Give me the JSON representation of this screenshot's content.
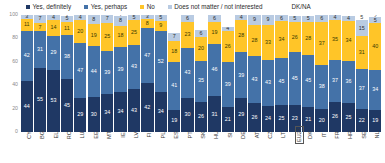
{
  "legend": {
    "items": [
      {
        "label": "Yes, definitely",
        "color": "#1f3864",
        "shape": "square"
      },
      {
        "label": "Yes, perhaps",
        "color": "#4472a8",
        "shape": "square"
      },
      {
        "label": "No",
        "color": "#ffc528",
        "shape": "square"
      },
      {
        "label": "Does not matter / not interested",
        "color": "#b9cbe2",
        "shape": "square"
      }
    ],
    "plain_label": "DK/NA"
  },
  "axis": {
    "y_ticks": [
      "100",
      "80",
      "60",
      "40",
      "20",
      "0"
    ]
  },
  "chart_data": {
    "type": "bar",
    "subtype": "stacked-bar-100-percent",
    "title": "",
    "xlabel": "",
    "ylabel": "",
    "ylim": [
      0,
      100
    ],
    "grid": false,
    "legend_position": "top",
    "categories": [
      "CY",
      "BG",
      "EL",
      "RO",
      "LU",
      "EE",
      "MT",
      "IE",
      "LV",
      "FI",
      "PL",
      "ES",
      "PT",
      "SK",
      "HU",
      "SI",
      "DE",
      "AT",
      "CZ",
      "LT",
      "EU27",
      "DK",
      "IT",
      "FR",
      "HR",
      "SE",
      "NL"
    ],
    "highlight_category": "EU27",
    "series": [
      {
        "name": "Yes, definitely",
        "color": "#1f3864",
        "values": [
          44,
          55,
          53,
          45,
          29,
          30,
          34,
          34,
          43,
          42,
          34,
          19,
          30,
          26,
          31,
          21,
          29,
          26,
          24,
          25,
          23,
          21,
          20,
          26,
          25,
          22,
          19
        ]
      },
      {
        "name": "Yes, perhaps",
        "color": "#4472a8",
        "values": [
          42,
          31,
          29,
          38,
          47,
          44,
          39,
          39,
          43,
          47,
          52,
          41,
          43,
          35,
          46,
          39,
          39,
          43,
          43,
          45,
          45,
          45,
          38,
          37,
          36,
          37,
          34
        ]
      },
      {
        "name": "No",
        "color": "#ffc528",
        "values": [
          11,
          7,
          14,
          11,
          20,
          19,
          25,
          18,
          25,
          8,
          9,
          18,
          23,
          20,
          19,
          26,
          28,
          28,
          33,
          34,
          26,
          28,
          37,
          35,
          34,
          31,
          40
        ]
      },
      {
        "name": "Does not matter / not interested",
        "color": "#b9cbe2",
        "values": [
          3,
          7,
          4,
          5,
          4,
          8,
          7,
          8,
          5,
          3,
          5,
          7,
          6,
          6,
          6,
          4,
          4,
          9,
          9,
          6,
          5,
          5,
          6,
          4,
          4,
          15,
          5
        ]
      },
      {
        "name": "DK/NA",
        "color": "#ffffff",
        "values": [
          0,
          0,
          0,
          1,
          0,
          0,
          0,
          1,
          0,
          0,
          0,
          0,
          0,
          0,
          0,
          0,
          0,
          0,
          0,
          0,
          0,
          0,
          0,
          0,
          0,
          5,
          2
        ]
      }
    ],
    "labels": {
      "Yes, definitely": [
        "44",
        "55",
        "53",
        "45",
        "29",
        "30",
        "34",
        "34",
        "43",
        "42",
        "34",
        "19",
        "30",
        "26",
        "31",
        "21",
        "29",
        "26",
        "24",
        "25",
        "23",
        "21",
        "20",
        "26",
        "25",
        "22",
        "19"
      ],
      "Yes, perhaps": [
        "42",
        "31",
        "29",
        "38",
        "47",
        "44",
        "39",
        "39",
        "43",
        "47",
        "52",
        "41",
        "43",
        "35",
        "46",
        "39",
        "39",
        "43",
        "43",
        "45",
        "45",
        "45",
        "38",
        "37",
        "36",
        "37",
        "34"
      ],
      "No": [
        "11",
        "7",
        "14",
        "11",
        "20",
        "19",
        "25",
        "18",
        "25",
        "8",
        "9",
        "18",
        "23",
        "20",
        "19",
        "26",
        "28",
        "28",
        "33",
        "34",
        "26",
        "28",
        "37",
        "35",
        "34",
        "31",
        "40"
      ],
      "Does not matter / not interested": [
        "3",
        "7",
        "4",
        "5",
        "4",
        "8",
        "7",
        "8",
        "5",
        "3",
        "5",
        "7",
        "6",
        "6",
        "6",
        "4",
        "4",
        "9",
        "9",
        "6",
        "5",
        "5",
        "6",
        "4",
        "4",
        "15",
        "5"
      ],
      "DK/NA": [
        "",
        "",
        "",
        "1",
        "",
        "",
        "",
        "1",
        "",
        "",
        "",
        "",
        "",
        "",
        "",
        "",
        "",
        "",
        "",
        "",
        "",
        "",
        "",
        "",
        "",
        "5",
        "2"
      ]
    }
  }
}
